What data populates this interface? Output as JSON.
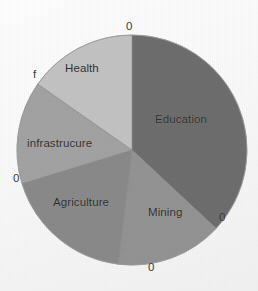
{
  "chart_data": {
    "type": "pie",
    "title": "",
    "subtitle": "",
    "xlabel": "",
    "ylabel": "",
    "legend_position": "none",
    "grid": false,
    "labels_inside_slices": true,
    "categories": [
      "Education",
      "Mining",
      "Agriculture",
      "infrastrucure",
      "Health"
    ],
    "values": [
      37,
      15,
      18,
      14,
      16
    ],
    "value_labels": [
      "0",
      "0",
      "0",
      "0",
      "f"
    ],
    "start_angle_deg": 0,
    "direction": "clockwise",
    "slices": [
      {
        "label": "Education",
        "value": 37,
        "data_label": "0",
        "color": "#6e6e6e",
        "start_angle_deg": 0,
        "end_angle_deg": 133
      },
      {
        "label": "Mining",
        "value": 15,
        "data_label": "0",
        "color": "#949494",
        "start_angle_deg": 133,
        "end_angle_deg": 187
      },
      {
        "label": "Agriculture",
        "value": 18,
        "data_label": "0",
        "color": "#8a8a8a",
        "start_angle_deg": 187,
        "end_angle_deg": 253
      },
      {
        "label": "infrastrucure",
        "value": 14,
        "data_label": "0",
        "color": "#a3a3a3",
        "start_angle_deg": 253,
        "end_angle_deg": 305
      },
      {
        "label": "Health",
        "value": 16,
        "data_label": "f",
        "color": "#c3c3c3",
        "start_angle_deg": 305,
        "end_angle_deg": 360
      }
    ],
    "outline_color": "#888888",
    "background_color": "#fdfdfd"
  },
  "slice_labels": {
    "education": "Education",
    "mining": "Mining",
    "agriculture": "Agriculture",
    "infrastructure": "infrastrucure",
    "health": "Health"
  },
  "data_labels": {
    "top": "0",
    "right": "0",
    "bottom": "0",
    "left": "0",
    "upper_left": "f"
  }
}
